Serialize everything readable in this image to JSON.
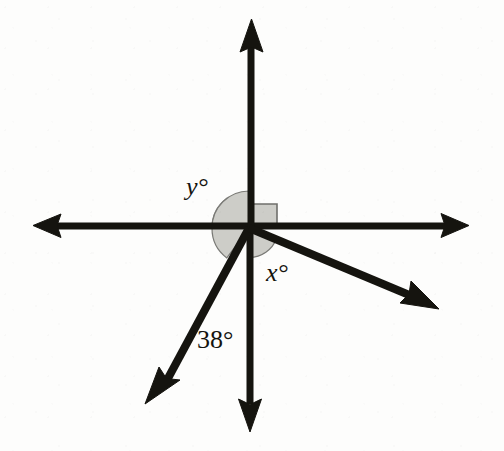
{
  "figure": {
    "type": "geometry-diagram",
    "width": 504,
    "height": 451,
    "background_color": "#fdfdfc",
    "stroke_color": "#15140f",
    "sector_fill_color": "#cdcdc8",
    "sector_stroke_color": "#6f6f6b"
  },
  "vertex": {
    "label": "intersection point",
    "x": 249,
    "y": 228
  },
  "rays": [
    {
      "name": "ray-up",
      "direction": "up",
      "angle_deg": 90,
      "tip_x": 252,
      "tip_y": 20,
      "arrow": true
    },
    {
      "name": "ray-down",
      "direction": "down",
      "angle_deg": 270,
      "tip_x": 250,
      "tip_y": 431,
      "arrow": true
    },
    {
      "name": "ray-left",
      "direction": "left",
      "angle_deg": 180,
      "tip_x": 35,
      "tip_y": 225,
      "arrow": true
    },
    {
      "name": "ray-right",
      "direction": "right",
      "angle_deg": 0,
      "tip_x": 467,
      "tip_y": 225,
      "arrow": true
    },
    {
      "name": "ray-down-left",
      "direction": "down-left",
      "angle_deg": 232,
      "tip_x": 147,
      "tip_y": 402,
      "arrow": true
    },
    {
      "name": "ray-down-right",
      "direction": "down-right",
      "angle_deg": 337.5,
      "tip_x": 437,
      "tip_y": 307,
      "arrow": true
    }
  ],
  "angles": [
    {
      "name": "angle-y",
      "label": "y°",
      "variable": "y",
      "unit": "degrees",
      "value": null,
      "marker": "shaded-sector",
      "between": [
        "ray-left",
        "ray-down-left"
      ],
      "label_x": 186,
      "label_y": 174
    },
    {
      "name": "angle-x",
      "label": "x°",
      "variable": "x",
      "unit": "degrees",
      "value": null,
      "marker": "shaded-sector",
      "between": [
        "ray-down-right",
        "ray-down"
      ],
      "label_x": 266,
      "label_y": 260
    },
    {
      "name": "angle-38",
      "label": "38°",
      "variable": null,
      "unit": "degrees",
      "value": 38,
      "marker": "none",
      "between": [
        "ray-down-left",
        "ray-down"
      ],
      "label_x": 197,
      "label_y": 327
    },
    {
      "name": "angle-right",
      "label": "",
      "variable": null,
      "unit": "degrees",
      "value": 90,
      "marker": "right-angle-square",
      "between": [
        "ray-up",
        "ray-right"
      ],
      "label_x": null,
      "label_y": null
    }
  ]
}
